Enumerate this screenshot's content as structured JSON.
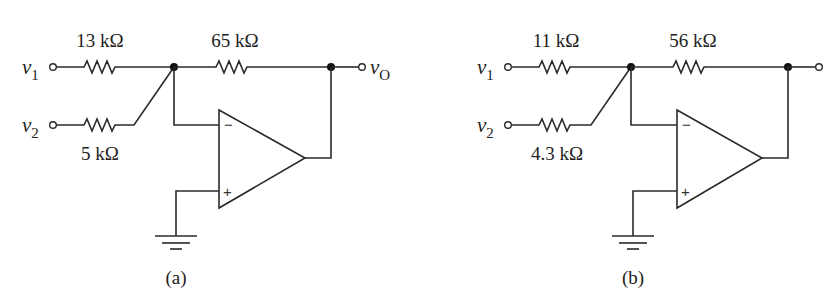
{
  "figure": {
    "circuits": [
      {
        "caption": "(a)",
        "inputs": [
          {
            "name": "v",
            "subscript": "1"
          },
          {
            "name": "v",
            "subscript": "2"
          }
        ],
        "output": {
          "name": "v",
          "subscript": "O"
        },
        "resistors": {
          "r1_label": "13 kΩ",
          "r2_label": "5 kΩ",
          "rf_label": "65 kΩ"
        },
        "opamp": {
          "minus": "−",
          "plus": "+"
        }
      },
      {
        "caption": "(b)",
        "inputs": [
          {
            "name": "v",
            "subscript": "1"
          },
          {
            "name": "v",
            "subscript": "2"
          }
        ],
        "output": {
          "name": "",
          "subscript": ""
        },
        "resistors": {
          "r1_label": "11 kΩ",
          "r2_label": "4.3 kΩ",
          "rf_label": "56 kΩ"
        },
        "opamp": {
          "minus": "−",
          "plus": "+"
        }
      }
    ]
  }
}
